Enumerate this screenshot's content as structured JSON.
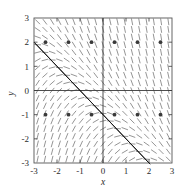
{
  "figure": {
    "corner_label": "",
    "background": "#ffffff"
  },
  "chart_data": {
    "type": "scatter",
    "title": "",
    "subtitle": "",
    "xlabel": "x",
    "ylabel": "y",
    "xlim": [
      -3,
      3
    ],
    "ylim": [
      -3,
      3
    ],
    "grid": false,
    "legend": null,
    "xticks": [
      -3,
      -2,
      -1,
      0,
      1,
      2,
      3
    ],
    "xticklabels": [
      "-3",
      "-2",
      "-1",
      "0",
      "1",
      "2",
      "3"
    ],
    "yticks": [
      -3,
      -2,
      -1,
      0,
      1,
      2,
      3
    ],
    "yticklabels": [
      "-3",
      "-2",
      "-1",
      "0",
      "1",
      "2",
      "3"
    ],
    "series": [
      {
        "name": "slope-field",
        "kind": "direction-field",
        "color": "#7a7a7a",
        "grid_nx": 19,
        "grid_ny": 19,
        "segment_length": 0.22,
        "slope_formula": "dy/dx = -(x + y + 1) * k",
        "note": "short dashes whose inclination encodes the slope at each grid point"
      },
      {
        "name": "solution-line",
        "kind": "line",
        "color": "#1a1a1a",
        "double_stroke": true,
        "x": [
          -3,
          2
        ],
        "y": [
          2,
          -3
        ],
        "equation": "y = -x - 1",
        "slope": -1,
        "intercept": -1
      },
      {
        "name": "marked-points",
        "kind": "scatter",
        "color": "#3a3a3a",
        "marker": "filled-circle",
        "points": [
          {
            "x": -2.5,
            "y": 2
          },
          {
            "x": -1.5,
            "y": 2
          },
          {
            "x": -0.5,
            "y": 2
          },
          {
            "x": 0.5,
            "y": 2
          },
          {
            "x": 1.5,
            "y": 2
          },
          {
            "x": 2.5,
            "y": 2
          },
          {
            "x": -2.5,
            "y": -1
          },
          {
            "x": -1.5,
            "y": -1
          },
          {
            "x": -0.5,
            "y": -1
          },
          {
            "x": 0.5,
            "y": -1
          },
          {
            "x": 1.5,
            "y": -1
          },
          {
            "x": 2.5,
            "y": -1
          }
        ]
      }
    ]
  }
}
